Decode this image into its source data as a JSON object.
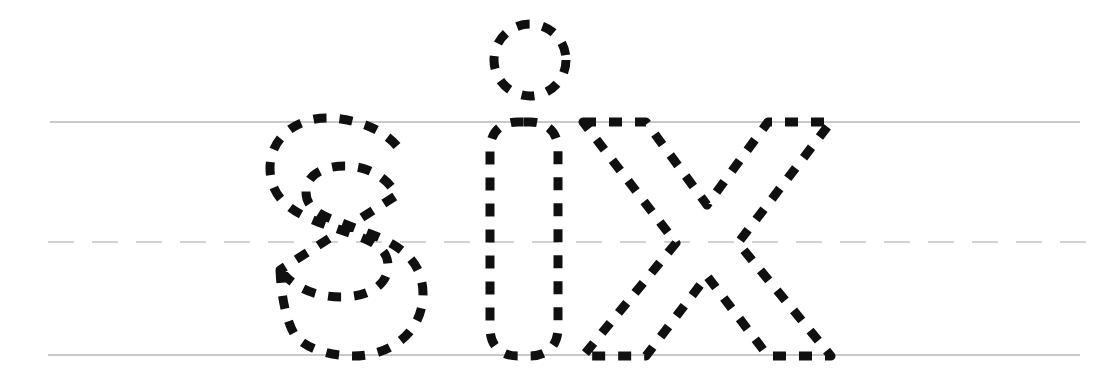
{
  "worksheet": {
    "type": "handwriting-tracing-worksheet",
    "word": "six",
    "letters": [
      "s",
      "i",
      "x"
    ],
    "letter_case": "lowercase",
    "script_style": "print-manuscript",
    "trace_style": "dashed-outline",
    "stroke_color": "#101010",
    "background_color": "#ffffff",
    "canvas": {
      "width": 1119,
      "height": 375
    }
  },
  "guidelines": {
    "top_line": {
      "name": "midline-top",
      "style": "solid",
      "color": "#c9c9c9",
      "y": 122,
      "x_start": 50,
      "x_end": 1080
    },
    "middle_line": {
      "name": "dotted-midline",
      "style": "dashed",
      "color": "#d2d2d2",
      "y": 242,
      "x_start": 48,
      "x_end": 1086
    },
    "bottom_line": {
      "name": "baseline",
      "style": "solid",
      "color": "#c9c9c9",
      "y": 355,
      "x_start": 48,
      "x_end": 1080
    }
  },
  "glyphs": [
    {
      "char": "s",
      "name": "letter-s",
      "bbox": {
        "x": 268,
        "y": 118,
        "width": 155,
        "height": 238
      },
      "stroke_count": 1
    },
    {
      "char": "i",
      "name": "letter-i",
      "bbox": {
        "x": 488,
        "y": 24,
        "width": 78,
        "height": 332
      },
      "stroke_count": 2,
      "parts": [
        "stem",
        "tittle"
      ],
      "tittle": {
        "cx": 530,
        "cy": 60,
        "r": 36
      }
    },
    {
      "char": "x",
      "name": "letter-x",
      "bbox": {
        "x": 583,
        "y": 119,
        "width": 248,
        "height": 237
      },
      "stroke_count": 2
    }
  ],
  "accessibility": {
    "alt_text": "Handwriting tracing worksheet showing the word six in dashed outline letters on three ruled guide lines."
  }
}
